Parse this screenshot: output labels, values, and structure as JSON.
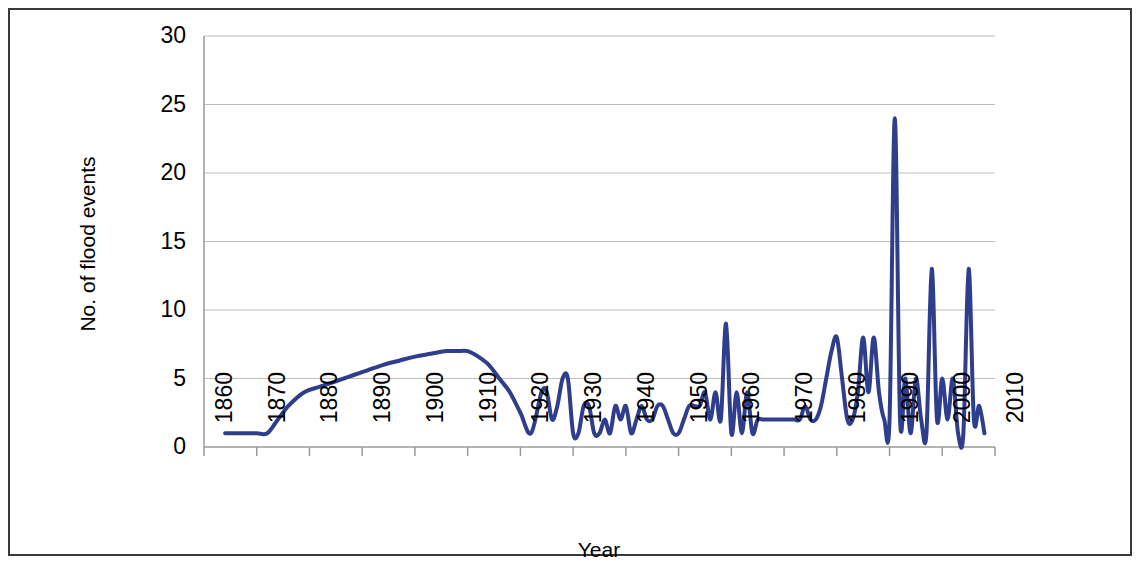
{
  "chart_data": {
    "type": "line",
    "title": "",
    "xlabel": "Year",
    "ylabel": "No. of flood events",
    "xlim": [
      1860,
      2010
    ],
    "ylim": [
      0,
      30
    ],
    "yticks": [
      0,
      5,
      10,
      15,
      20,
      25,
      30
    ],
    "xticks": [
      1860,
      1870,
      1880,
      1890,
      1900,
      1910,
      1920,
      1930,
      1940,
      1950,
      1960,
      1970,
      1980,
      1990,
      2000,
      2010
    ],
    "grid": "horizontal",
    "legend": "none",
    "series": [
      {
        "name": "No. of flood events",
        "color": "#2F3E8C",
        "smoothing": "spline",
        "x": [
          1864,
          1866,
          1868,
          1870,
          1872,
          1874,
          1876,
          1879,
          1882,
          1885,
          1888,
          1891,
          1894,
          1897,
          1900,
          1903,
          1906,
          1908,
          1910,
          1912,
          1914,
          1916,
          1918,
          1920,
          1922,
          1924,
          1925,
          1926,
          1927,
          1928,
          1929,
          1930,
          1931,
          1932,
          1933,
          1934,
          1935,
          1936,
          1937,
          1938,
          1939,
          1940,
          1941,
          1942,
          1943,
          1944,
          1945,
          1946,
          1947,
          1948,
          1949,
          1950,
          1951,
          1952,
          1953,
          1954,
          1955,
          1956,
          1957,
          1958,
          1959,
          1960,
          1961,
          1962,
          1963,
          1964,
          1965,
          1966,
          1967,
          1968,
          1969,
          1970,
          1971,
          1972,
          1973,
          1974,
          1975,
          1976,
          1977,
          1978,
          1979,
          1980,
          1981,
          1982,
          1983,
          1984,
          1985,
          1986,
          1987,
          1988,
          1989,
          1990,
          1991,
          1992,
          1993,
          1994,
          1995,
          1996,
          1997,
          1998,
          1999,
          2000,
          2001,
          2002,
          2003,
          2004,
          2005,
          2006,
          2007,
          2008
        ],
        "y": [
          1,
          1,
          1,
          1,
          1,
          2,
          3,
          4,
          4.4,
          4.8,
          5.2,
          5.6,
          6,
          6.3,
          6.6,
          6.8,
          7,
          7,
          7,
          6.6,
          6,
          5,
          4,
          2.5,
          1,
          4,
          4,
          2,
          3,
          5,
          5,
          1,
          1,
          3,
          3,
          1,
          1,
          2,
          1,
          3,
          2,
          3,
          1,
          2,
          3,
          2,
          2,
          3,
          3,
          2,
          1,
          1,
          2,
          3,
          3,
          3,
          4,
          2,
          4,
          2,
          9,
          1,
          4,
          1,
          4,
          1,
          2,
          2,
          2,
          2,
          2,
          2,
          2,
          2,
          2,
          3,
          2,
          2,
          3,
          5,
          7,
          8,
          5,
          2,
          2,
          4,
          8,
          4,
          8,
          4,
          2,
          2,
          24,
          2,
          5,
          1,
          5,
          2,
          1,
          13,
          2,
          5,
          2,
          5,
          1,
          1,
          13,
          2,
          3,
          1
        ]
      }
    ]
  },
  "axis": {
    "y_tick_labels": [
      "30",
      "25",
      "20",
      "15",
      "10",
      "5",
      "0"
    ],
    "x_tick_labels": [
      "1860",
      "1870",
      "1880",
      "1890",
      "1900",
      "1910",
      "1920",
      "1930",
      "1940",
      "1950",
      "1960",
      "1970",
      "1980",
      "1990",
      "2000",
      "2010"
    ],
    "y_title": "No. of flood events",
    "x_title": "Year"
  },
  "style": {
    "line_color": "#2F3E8C",
    "grid_color": "#BFBFBF",
    "axis_color": "#9A9A9A",
    "frame_color": "#3A3A3A",
    "background": "#FFFFFF"
  }
}
